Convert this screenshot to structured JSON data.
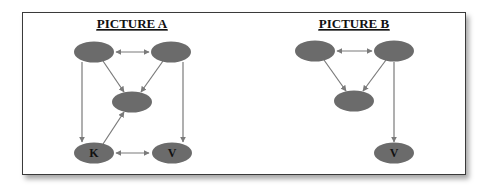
{
  "colors": {
    "node_fill": "#6b6b6b",
    "edge": "#7a7a7a",
    "frame_border": "#3a3a3a",
    "text": "#111111"
  },
  "pictures": [
    {
      "title": "PICTURE A",
      "nodes": [
        {
          "id": "a_tl",
          "label": "",
          "cx": 94,
          "cy": 52
        },
        {
          "id": "a_tr",
          "label": "",
          "cx": 171,
          "cy": 52
        },
        {
          "id": "a_mid",
          "label": "",
          "cx": 132,
          "cy": 102
        },
        {
          "id": "a_k",
          "label": "K",
          "cx": 94,
          "cy": 153
        },
        {
          "id": "a_v",
          "label": "V",
          "cx": 172,
          "cy": 153
        }
      ],
      "edges": [
        {
          "from": "a_tl",
          "to": "a_tr",
          "type": "bidirectional"
        },
        {
          "from": "a_tl",
          "to": "a_mid",
          "type": "directed"
        },
        {
          "from": "a_tr",
          "to": "a_mid",
          "type": "directed"
        },
        {
          "from": "a_tl",
          "to": "a_k",
          "type": "directed"
        },
        {
          "from": "a_tr",
          "to": "a_v",
          "type": "directed"
        },
        {
          "from": "a_k",
          "to": "a_mid",
          "type": "directed"
        },
        {
          "from": "a_k",
          "to": "a_v",
          "type": "bidirectional"
        }
      ]
    },
    {
      "title": "PICTURE B",
      "nodes": [
        {
          "id": "b_tl",
          "label": "",
          "cx": 315,
          "cy": 51
        },
        {
          "id": "b_tr",
          "label": "",
          "cx": 394,
          "cy": 51
        },
        {
          "id": "b_mid",
          "label": "",
          "cx": 354,
          "cy": 101
        },
        {
          "id": "b_v",
          "label": "V",
          "cx": 394,
          "cy": 153
        }
      ],
      "edges": [
        {
          "from": "b_tl",
          "to": "b_tr",
          "type": "bidirectional"
        },
        {
          "from": "b_tl",
          "to": "b_mid",
          "type": "directed"
        },
        {
          "from": "b_tr",
          "to": "b_mid",
          "type": "directed"
        },
        {
          "from": "b_tr",
          "to": "b_v",
          "type": "directed"
        }
      ]
    }
  ]
}
